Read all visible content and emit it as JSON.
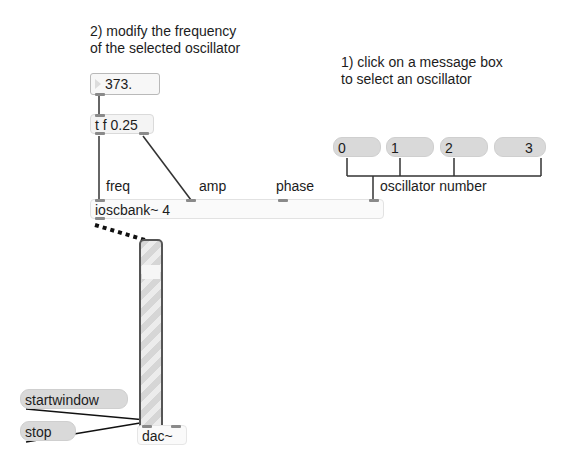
{
  "comments": {
    "step2_line1": "2) modify the frequency",
    "step2_line2": "of the selected oscillator",
    "step1_line1": "1) click on a message box",
    "step1_line2": "to select an oscillator",
    "freq": "freq",
    "amp": "amp",
    "phase": "phase",
    "oscillator_number": "oscillator number"
  },
  "objects": {
    "number_box_value": "373.",
    "trigger": "t f 0.25",
    "ioscbank": "ioscbank~ 4",
    "dac": "dac~"
  },
  "messages": {
    "osc_selectors": [
      "0",
      "1",
      "2",
      "3"
    ],
    "startwindow": "startwindow",
    "stop": "stop"
  },
  "gain_slider": {
    "value_fraction": 0.85
  },
  "colors": {
    "background": "#ffffff",
    "object_fill": "#f4f4f4",
    "message_fill": "#d9d9d9",
    "cord": "#222222",
    "signal_cord": "#222222",
    "port": "#8a8a8a"
  }
}
